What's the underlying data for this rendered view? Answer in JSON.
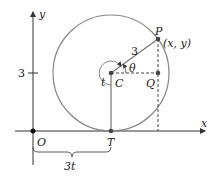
{
  "diagram": {
    "title": "",
    "axes": {
      "x_label": "x",
      "y_label": "y",
      "y_tick_label": "3"
    },
    "points": {
      "origin": "O",
      "center": "C",
      "point_on_circle": "P",
      "point_coords": "(x, y)",
      "foot_point": "Q",
      "tangent_point": "T"
    },
    "labels": {
      "radius": "3",
      "angle_theta": "θ",
      "angle_t": "t",
      "distance": "3t"
    },
    "colors": {
      "circle": "#8a8480",
      "axis": "#333333",
      "radius_line": "#7a7470",
      "point": "#444444"
    }
  }
}
